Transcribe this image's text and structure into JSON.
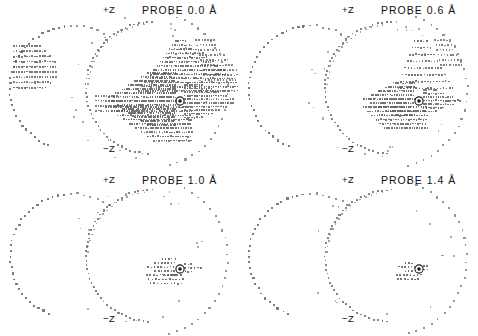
{
  "figure": {
    "background_color": "#ffffff",
    "dot_color": "#555555",
    "arc_dot_color": "#666666",
    "marker_color": "#1a1a1a",
    "axis_label_top": "+Z",
    "axis_label_bottom": "−Z"
  },
  "chart_data": {
    "type": "scatter",
    "xlabel": "",
    "ylabel": "",
    "legend_position": "none",
    "grid": false,
    "panel_count": 4,
    "panel_layout": "2x2",
    "axis_annotations": [
      "+Z",
      "−Z"
    ],
    "series_description": "Dot-surface points: two overlapping arc contours plus horizontal row clusters of surface dots; density decreases as probe radius increases",
    "panels": [
      {
        "index": 0,
        "title": "PROBE 0.0 Å",
        "probe_radius": 0.0,
        "units": "Å",
        "position": "top-left",
        "label_top": "+Z",
        "label_bottom": "−Z",
        "dot_density": "very high",
        "cluster_rows": 22,
        "marker": {
          "name": "atom-center",
          "circled": true,
          "x": 180,
          "y": 101
        }
      },
      {
        "index": 1,
        "title": "PROBE 0.6 Å",
        "probe_radius": 0.6,
        "units": "Å",
        "position": "top-right",
        "label_top": "+Z",
        "label_bottom": "−Z",
        "dot_density": "high",
        "cluster_rows": 14,
        "marker": {
          "name": "atom-center",
          "circled": true,
          "x": 180,
          "y": 101
        }
      },
      {
        "index": 2,
        "title": "PROBE 1.0 Å",
        "probe_radius": 1.0,
        "units": "Å",
        "position": "bottom-left",
        "label_top": "+Z",
        "label_bottom": "−Z",
        "dot_density": "low",
        "cluster_rows": 7,
        "marker": {
          "name": "atom-center",
          "circled": true,
          "x": 180,
          "y": 101
        }
      },
      {
        "index": 3,
        "title": "PROBE 1.4 Å",
        "probe_radius": 1.4,
        "units": "Å",
        "position": "bottom-right",
        "label_top": "+Z",
        "label_bottom": "−Z",
        "dot_density": "very low",
        "cluster_rows": 4,
        "marker": {
          "name": "atom-center",
          "circled": true,
          "x": 180,
          "y": 101
        }
      }
    ]
  }
}
